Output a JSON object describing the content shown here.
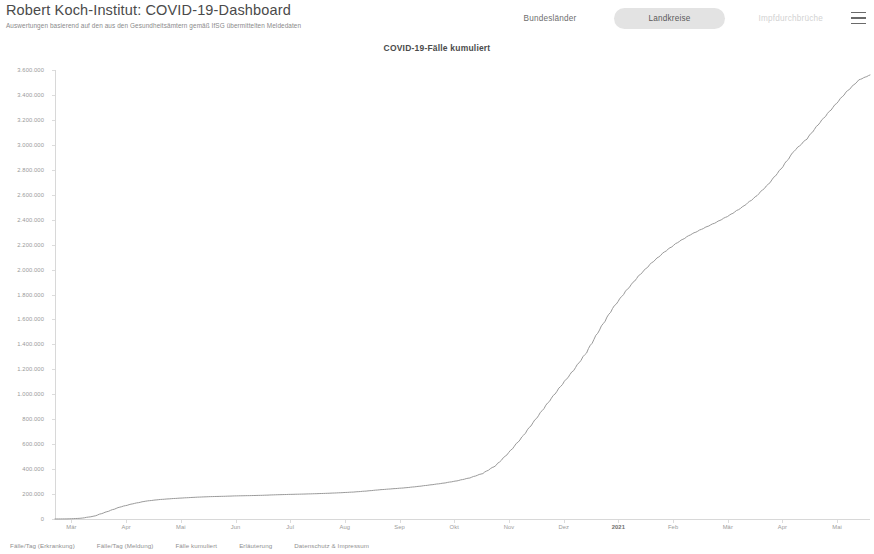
{
  "header": {
    "title": "Robert Koch-Institut: COVID-19-Dashboard",
    "subtitle": "Auswertungen basierend auf den aus den Gesundheitsämtern gemäß IfSG übermittelten Meldedaten",
    "nav": [
      {
        "label": "Bundesländer",
        "state": "normal"
      },
      {
        "label": "Landkreise",
        "state": "selected"
      },
      {
        "label": "Impfdurchbrüche",
        "state": "faded"
      }
    ],
    "menu_icon": "hamburger-menu-icon"
  },
  "chart_data": {
    "type": "line",
    "title": "COVID-19-Fälle kumuliert",
    "xlabel": "",
    "ylabel": "",
    "grid": false,
    "legend": false,
    "ylim": [
      0,
      3600000
    ],
    "ytick_step": 200000,
    "ytick_labels": [
      "3.600.000",
      "3.400.000",
      "3.200.000",
      "3.000.000",
      "2.800.000",
      "2.600.000",
      "2.400.000",
      "2.200.000",
      "2.000.000",
      "1.800.000",
      "1.600.000",
      "1.400.000",
      "1.200.000",
      "1.000.000",
      "800.000",
      "600.000",
      "400.000",
      "200.000",
      "0"
    ],
    "ytick_values": [
      3600000,
      3400000,
      3200000,
      3000000,
      2800000,
      2600000,
      2400000,
      2200000,
      2000000,
      1800000,
      1600000,
      1400000,
      1200000,
      1000000,
      800000,
      600000,
      400000,
      200000,
      0
    ],
    "xtick_labels": [
      "Mär",
      "Apr",
      "Mai",
      "Jun",
      "Jul",
      "Aug",
      "Sep",
      "Okt",
      "Nov",
      "Dez",
      "2021",
      "Feb",
      "Mär",
      "Apr",
      "Mai"
    ],
    "xlim": [
      "2020-03-01",
      "2021-05-15"
    ],
    "series_color": "#9a9a9a",
    "series": [
      {
        "name": "Fälle kumuliert",
        "x": [
          "2020-03-01",
          "2020-03-08",
          "2020-03-15",
          "2020-03-22",
          "2020-03-29",
          "2020-04-05",
          "2020-04-12",
          "2020-04-19",
          "2020-04-26",
          "2020-05-03",
          "2020-05-10",
          "2020-05-17",
          "2020-05-24",
          "2020-05-31",
          "2020-06-07",
          "2020-06-14",
          "2020-06-21",
          "2020-06-28",
          "2020-07-05",
          "2020-07-12",
          "2020-07-19",
          "2020-07-26",
          "2020-08-02",
          "2020-08-09",
          "2020-08-16",
          "2020-08-23",
          "2020-08-30",
          "2020-09-06",
          "2020-09-13",
          "2020-09-20",
          "2020-09-27",
          "2020-10-04",
          "2020-10-11",
          "2020-10-18",
          "2020-10-25",
          "2020-11-01",
          "2020-11-08",
          "2020-11-15",
          "2020-11-22",
          "2020-11-29",
          "2020-12-06",
          "2020-12-13",
          "2020-12-20",
          "2020-12-27",
          "2021-01-03",
          "2021-01-10",
          "2021-01-17",
          "2021-01-24",
          "2021-01-31",
          "2021-02-07",
          "2021-02-14",
          "2021-02-21",
          "2021-02-28",
          "2021-03-07",
          "2021-03-14",
          "2021-03-21",
          "2021-03-28",
          "2021-04-04",
          "2021-04-11",
          "2021-04-18",
          "2021-04-25",
          "2021-05-02",
          "2021-05-09",
          "2021-05-15"
        ],
        "values": [
          130,
          1100,
          5800,
          22200,
          58200,
          95400,
          122200,
          143300,
          155400,
          163200,
          169500,
          175200,
          179400,
          182000,
          185400,
          187500,
          190000,
          194000,
          197000,
          199500,
          202500,
          206000,
          210500,
          216000,
          224000,
          234000,
          242000,
          250000,
          261000,
          274000,
          288000,
          306000,
          330000,
          366000,
          429000,
          532000,
          653000,
          790000,
          929000,
          1064000,
          1194000,
          1337000,
          1519000,
          1687000,
          1824000,
          1947000,
          2052000,
          2141000,
          2216000,
          2279000,
          2330000,
          2379000,
          2434000,
          2500000,
          2580000,
          2682000,
          2808000,
          2950000,
          3050000,
          3180000,
          3300000,
          3420000,
          3520000,
          3560000
        ]
      }
    ]
  },
  "footer": {
    "links": [
      "Fälle/Tag (Erkrankung)",
      "Fälle/Tag (Meldung)",
      "Fälle kumuliert",
      "Erläuterung",
      "Datenschutz & Impressum"
    ]
  }
}
